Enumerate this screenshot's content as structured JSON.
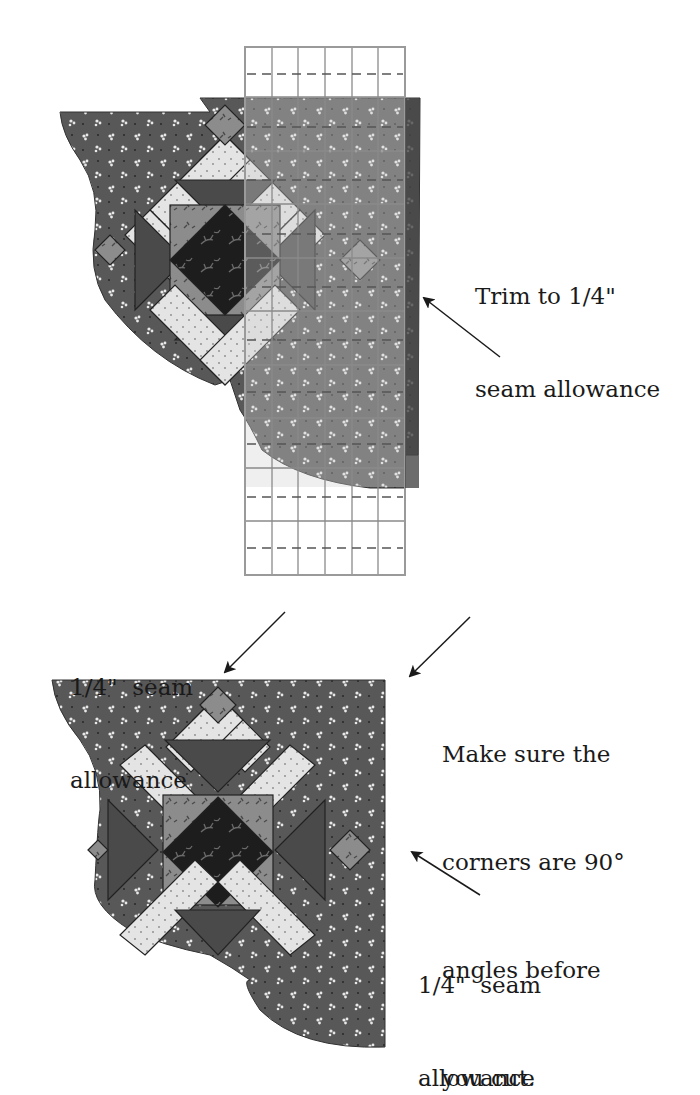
{
  "colors": {
    "background": "#ffffff",
    "dark_print": "#5a5a5a",
    "medium_print": "#8e8e8e",
    "light_print": "#e6e6e6",
    "center_dark": "#1e1e1e",
    "ruler_line": "#9a9a9a",
    "ruler_overlay": "rgba(200,200,200,0.35)",
    "arrow": "#1a1a1a"
  },
  "figure_top": {
    "name": "block-with-ruler",
    "ruler": {
      "columns": 6,
      "rows_visible": 11
    },
    "callout": {
      "lines": [
        "Trim to 1/4\"",
        "seam allowance"
      ]
    }
  },
  "figure_bottom": {
    "name": "trimmed-block",
    "callouts": [
      {
        "id": "top-left",
        "lines": [
          "1/4\"  seam",
          "allowance"
        ]
      },
      {
        "id": "right-top",
        "lines": [
          "Make sure the",
          "corners are 90°",
          "angles before",
          "you cut."
        ]
      },
      {
        "id": "right-bottom",
        "lines": [
          "1/4\"  seam",
          "allowance"
        ]
      }
    ]
  }
}
